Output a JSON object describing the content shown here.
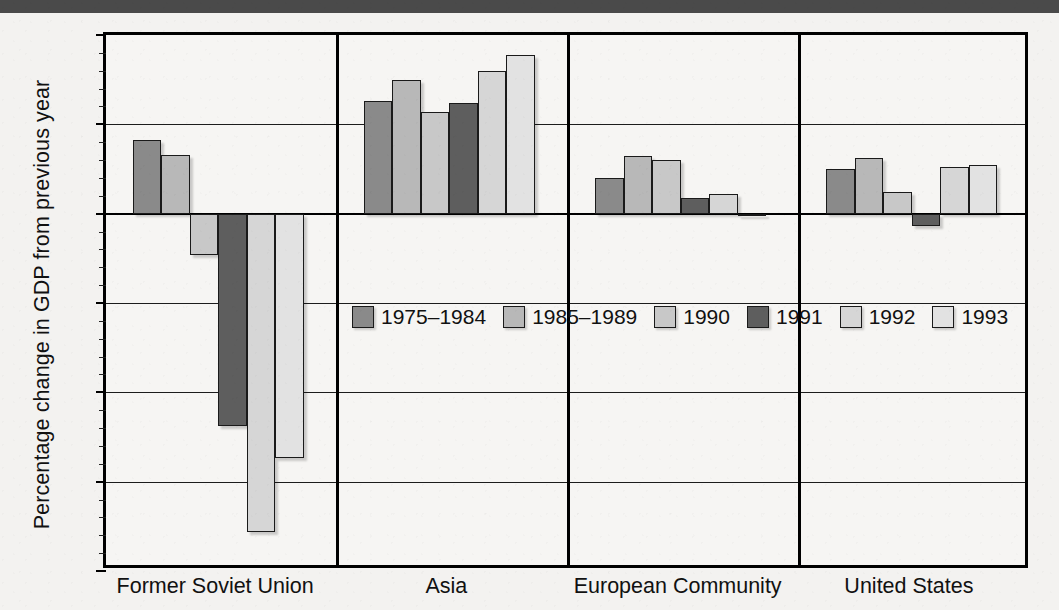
{
  "chart_data": {
    "type": "bar",
    "title": "",
    "xlabel": "",
    "ylabel": "Percentage change in GDP from previous year",
    "ylim": [
      -20,
      10
    ],
    "ytick_labels": [
      "10",
      "5",
      "0",
      "-5",
      "-10",
      "-15",
      "-20"
    ],
    "ytick_values": [
      10,
      5,
      0,
      -5,
      -10,
      -15,
      -20
    ],
    "minor_tick_step": 1,
    "grid": true,
    "grid_axis": "y",
    "legend_position": "center",
    "categories": [
      "Former Soviet Union",
      "Asia",
      "European Community",
      "United States"
    ],
    "series": [
      {
        "name": "1975–1984",
        "color": "#8a8a8a",
        "values": [
          4.1,
          6.3,
          2.0,
          2.5
        ]
      },
      {
        "name": "1985–1989",
        "color": "#b8b8b8",
        "values": [
          3.3,
          7.5,
          3.2,
          3.1
        ]
      },
      {
        "name": "1990",
        "color": "#c8c8c8",
        "values": [
          -2.3,
          5.7,
          3.0,
          1.2
        ]
      },
      {
        "name": "1991",
        "color": "#5e5e5e",
        "values": [
          -11.9,
          6.2,
          0.85,
          -0.7
        ]
      },
      {
        "name": "1992",
        "color": "#d6d6d6",
        "values": [
          -17.8,
          8.0,
          1.1,
          2.6
        ]
      },
      {
        "name": "1993",
        "color": "#e2e2e2",
        "values": [
          -13.7,
          8.9,
          -0.1,
          2.7
        ]
      }
    ]
  },
  "figure": {
    "axis_line_color": "#000000",
    "background_color": "#f3f2f0",
    "band_color": "#4a4a4a"
  }
}
